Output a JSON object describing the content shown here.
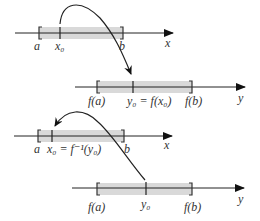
{
  "panel1": {
    "domain_axis": {
      "label": "x",
      "left": "a",
      "point": "x₀",
      "right": "b"
    },
    "range_axis": {
      "label": "y",
      "left": "f(a)",
      "point": "y₀ = f(x₀)",
      "right": "f(b)"
    }
  },
  "panel2": {
    "domain_axis": {
      "label": "x",
      "left": "a",
      "point": "x₀ = f⁻¹(y₀)",
      "right": "b"
    },
    "range_axis": {
      "label": "y",
      "left": "f(a)",
      "point": "y₀",
      "right": "f(b)"
    }
  },
  "colors": {
    "interval_fill": "#d9d9d9",
    "line": "#222222"
  }
}
